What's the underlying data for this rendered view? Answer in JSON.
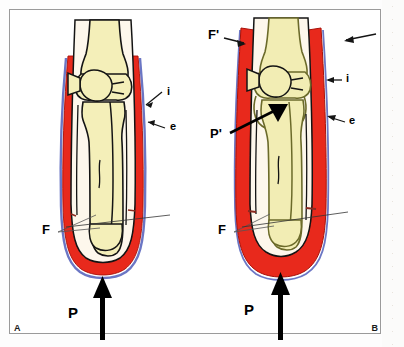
{
  "figure": {
    "panels": [
      {
        "id": "A",
        "letter": "A",
        "labels": {
          "internal": "i",
          "external": "e",
          "fascia": "F",
          "pressure": "P"
        }
      },
      {
        "id": "B",
        "letter": "B",
        "labels": {
          "fascia_prime": "F'",
          "internal": "i",
          "external": "e",
          "fascia": "F",
          "pressure_prime": "P'",
          "pressure": "P"
        }
      }
    ]
  },
  "colors": {
    "muscle_red": "#e8291c",
    "red_dark": "#c4160c",
    "bone_yellow": "#f4efb9",
    "bone_yellow_b": "#f2edb4",
    "soft_tissue": "#fdf7ec",
    "fascia_blue": "#6b76c4",
    "outline_black": "#141414",
    "outline_olive": "#6b6a2a",
    "frame_gray": "#9a9a9a",
    "leader_gray": "#4a4a4a",
    "paper_white": "#ffffff"
  },
  "icons": {
    "pressure_arrow": "thick-up-arrow",
    "pointer_arrow": "thin-arrow",
    "solid_arrow": "solid-black-arrow"
  }
}
